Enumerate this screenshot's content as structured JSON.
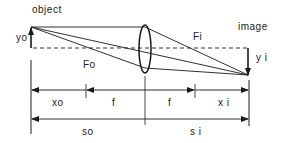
{
  "diagram": {
    "labels": {
      "object": "object",
      "image": "image",
      "yo": "yo",
      "yi": "y i",
      "Fo": "Fo",
      "Fi": "Fi",
      "xo": "xo",
      "f_left": "f",
      "f_right": "f",
      "xi": "x i",
      "so": "so",
      "si": "s i"
    },
    "colors": {
      "line": "#1a1a1a",
      "background": "#ffffff"
    }
  }
}
